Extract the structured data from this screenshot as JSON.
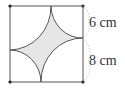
{
  "figure": {
    "square_side_cm": 14,
    "arcs": [
      {
        "corner": "top-left",
        "radius_cm": 8
      },
      {
        "corner": "top-right",
        "radius_cm": 6
      },
      {
        "corner": "bottom-right",
        "radius_cm": 8
      },
      {
        "corner": "bottom-left",
        "radius_cm": 6
      }
    ],
    "labels": {
      "upper_segment": "6 cm",
      "lower_segment": "8 cm"
    },
    "colors": {
      "stroke": "#555555",
      "fill": "#e6e6e6",
      "corner_dot": "#222222",
      "brace": "#bbbbbb"
    }
  }
}
